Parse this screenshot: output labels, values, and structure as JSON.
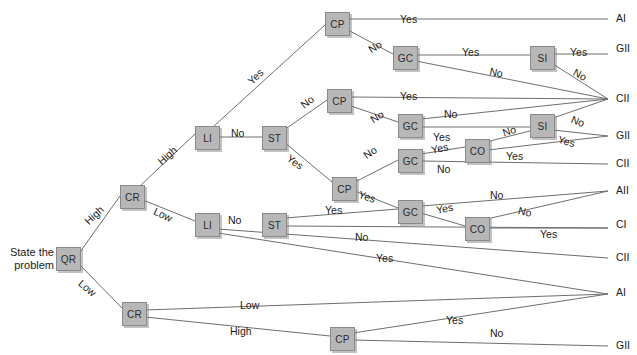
{
  "diagram": {
    "start_label": "State the\nproblem",
    "start_label_line1": "State the",
    "start_label_line2": "problem",
    "node_fill": "#b7b7b7",
    "node_stroke": "#8a8a8a",
    "line_color": "#6e6e6e",
    "nodes": [
      {
        "id": "QR",
        "label": "QR",
        "x": 56,
        "y": 247
      },
      {
        "id": "CR1",
        "label": "CR",
        "x": 120,
        "y": 185
      },
      {
        "id": "CR2",
        "label": "CR",
        "x": 122,
        "y": 302
      },
      {
        "id": "LI1",
        "label": "LI",
        "x": 195,
        "y": 126
      },
      {
        "id": "LI2",
        "label": "LI",
        "x": 195,
        "y": 213
      },
      {
        "id": "ST1",
        "label": "ST",
        "x": 262,
        "y": 126
      },
      {
        "id": "ST2",
        "label": "ST",
        "x": 262,
        "y": 213
      },
      {
        "id": "CP1",
        "label": "CP",
        "x": 325,
        "y": 12
      },
      {
        "id": "CP2",
        "label": "CP",
        "x": 327,
        "y": 89
      },
      {
        "id": "CP3",
        "label": "CP",
        "x": 332,
        "y": 177
      },
      {
        "id": "CP4",
        "label": "CP",
        "x": 330,
        "y": 327
      },
      {
        "id": "GC1",
        "label": "GC",
        "x": 393,
        "y": 46
      },
      {
        "id": "GC2",
        "label": "GC",
        "x": 398,
        "y": 114
      },
      {
        "id": "GC3",
        "label": "GC",
        "x": 398,
        "y": 149
      },
      {
        "id": "GC4",
        "label": "GC",
        "x": 398,
        "y": 200
      },
      {
        "id": "CO1",
        "label": "CO",
        "x": 465,
        "y": 139
      },
      {
        "id": "CO2",
        "label": "CO",
        "x": 465,
        "y": 217
      },
      {
        "id": "SI1",
        "label": "SI",
        "x": 530,
        "y": 46
      },
      {
        "id": "SI2",
        "label": "SI",
        "x": 530,
        "y": 114
      }
    ],
    "outcomes": [
      {
        "id": "o1",
        "label": "AI",
        "x": 616,
        "y": 12
      },
      {
        "id": "o2",
        "label": "GII",
        "x": 616,
        "y": 42
      },
      {
        "id": "o3",
        "label": "CII",
        "x": 616,
        "y": 92
      },
      {
        "id": "o4",
        "label": "GII",
        "x": 616,
        "y": 129
      },
      {
        "id": "o5",
        "label": "CII",
        "x": 616,
        "y": 157
      },
      {
        "id": "o6",
        "label": "AII",
        "x": 616,
        "y": 184
      },
      {
        "id": "o7",
        "label": "CI",
        "x": 616,
        "y": 218
      },
      {
        "id": "o8",
        "label": "CII",
        "x": 616,
        "y": 251
      },
      {
        "id": "o9",
        "label": "AI",
        "x": 616,
        "y": 286
      },
      {
        "id": "o10",
        "label": "GII",
        "x": 616,
        "y": 339
      }
    ],
    "edge_labels": [
      {
        "id": "e1",
        "text": "High",
        "x": 82,
        "y": 218,
        "rot": -43
      },
      {
        "id": "e2",
        "text": "Low",
        "x": 84,
        "y": 277,
        "rot": 40
      },
      {
        "id": "e3",
        "text": "High",
        "x": 155,
        "y": 158,
        "rot": -42
      },
      {
        "id": "e4",
        "text": "Low",
        "x": 157,
        "y": 205,
        "rot": 25
      },
      {
        "id": "e5",
        "text": "Yes",
        "x": 245,
        "y": 78,
        "rot": -44
      },
      {
        "id": "e6",
        "text": "No",
        "x": 231,
        "y": 127,
        "rot": 0
      },
      {
        "id": "e7",
        "text": "No",
        "x": 298,
        "y": 101,
        "rot": -38
      },
      {
        "id": "e8",
        "text": "Yes",
        "x": 292,
        "y": 152,
        "rot": 36
      },
      {
        "id": "e9",
        "text": "No",
        "x": 228,
        "y": 214,
        "rot": 0
      },
      {
        "id": "e10",
        "text": "Yes",
        "x": 325,
        "y": 204,
        "rot": 0
      },
      {
        "id": "e11",
        "text": "No",
        "x": 355,
        "y": 231,
        "rot": 0
      },
      {
        "id": "e12",
        "text": "Yes",
        "x": 376,
        "y": 252,
        "rot": 0
      },
      {
        "id": "e13",
        "text": "Yes",
        "x": 400,
        "y": 13,
        "rot": 0
      },
      {
        "id": "e14",
        "text": "No",
        "x": 366,
        "y": 45,
        "rot": -32
      },
      {
        "id": "e15",
        "text": "Yes",
        "x": 462,
        "y": 46,
        "rot": 0
      },
      {
        "id": "e16",
        "text": "No",
        "x": 491,
        "y": 65,
        "rot": 12
      },
      {
        "id": "e17",
        "text": "Yes",
        "x": 570,
        "y": 46,
        "rot": 0
      },
      {
        "id": "e18",
        "text": "No",
        "x": 577,
        "y": 66,
        "rot": 28
      },
      {
        "id": "e19",
        "text": "Yes",
        "x": 400,
        "y": 90,
        "rot": 0
      },
      {
        "id": "e20",
        "text": "No",
        "x": 368,
        "y": 115,
        "rot": -32
      },
      {
        "id": "e21",
        "text": "No",
        "x": 444,
        "y": 108,
        "rot": 0
      },
      {
        "id": "e22",
        "text": "Yes",
        "x": 433,
        "y": 131,
        "rot": 0
      },
      {
        "id": "e23",
        "text": "No",
        "x": 501,
        "y": 127,
        "rot": -18
      },
      {
        "id": "e24",
        "text": "No",
        "x": 574,
        "y": 113,
        "rot": 22
      },
      {
        "id": "e25",
        "text": "Yes",
        "x": 560,
        "y": 133,
        "rot": 16
      },
      {
        "id": "e26",
        "text": "No",
        "x": 361,
        "y": 151,
        "rot": -34
      },
      {
        "id": "e27",
        "text": "Yes",
        "x": 430,
        "y": 144,
        "rot": -12
      },
      {
        "id": "e28",
        "text": "No",
        "x": 437,
        "y": 163,
        "rot": 0
      },
      {
        "id": "e29",
        "text": "Yes",
        "x": 506,
        "y": 150,
        "rot": 0
      },
      {
        "id": "e30",
        "text": "Yes",
        "x": 361,
        "y": 188,
        "rot": 19
      },
      {
        "id": "e31",
        "text": "No",
        "x": 490,
        "y": 189,
        "rot": 0
      },
      {
        "id": "e32",
        "text": "No",
        "x": 520,
        "y": 204,
        "rot": 14
      },
      {
        "id": "e33",
        "text": "Yes",
        "x": 435,
        "y": 204,
        "rot": -11
      },
      {
        "id": "e34",
        "text": "Yes",
        "x": 540,
        "y": 228,
        "rot": 0
      },
      {
        "id": "e35",
        "text": "Low",
        "x": 240,
        "y": 299,
        "rot": 0
      },
      {
        "id": "e36",
        "text": "High",
        "x": 230,
        "y": 325,
        "rot": 0
      },
      {
        "id": "e37",
        "text": "Yes",
        "x": 446,
        "y": 314,
        "rot": 0
      },
      {
        "id": "e38",
        "text": "No",
        "x": 490,
        "y": 327,
        "rot": 0
      }
    ],
    "edges": [
      {
        "id": "E-QR-CR1",
        "from": "QR",
        "to": "CR1",
        "label": "High"
      },
      {
        "id": "E-QR-CR2",
        "from": "QR",
        "to": "CR2",
        "label": "Low"
      },
      {
        "id": "E-CR1-LI1",
        "from": "CR1",
        "to": "LI1",
        "label": "High"
      },
      {
        "id": "E-CR1-LI2",
        "from": "CR1",
        "to": "LI2",
        "label": "Low"
      },
      {
        "id": "E-LI1-CP1",
        "from": "LI1",
        "to": "CP1",
        "label": "Yes"
      },
      {
        "id": "E-LI1-ST1",
        "from": "LI1",
        "to": "ST1",
        "label": "No"
      },
      {
        "id": "E-ST1-CP2",
        "from": "ST1",
        "to": "CP2",
        "label": "No"
      },
      {
        "id": "E-ST1-CP3",
        "from": "ST1",
        "to": "CP3",
        "label": "Yes"
      },
      {
        "id": "E-CP1-AI",
        "from": "CP1",
        "to": "o1",
        "label": "Yes"
      },
      {
        "id": "E-CP1-GC1",
        "from": "CP1",
        "to": "GC1",
        "label": "No"
      },
      {
        "id": "E-GC1-SI1",
        "from": "GC1",
        "to": "SI1",
        "label": "Yes"
      },
      {
        "id": "E-GC1-CII",
        "from": "GC1",
        "to": "o3",
        "label": "No"
      },
      {
        "id": "E-SI1-GII",
        "from": "SI1",
        "to": "o2",
        "label": "Yes"
      },
      {
        "id": "E-SI1-CII",
        "from": "SI1",
        "to": "o3",
        "label": "No"
      },
      {
        "id": "E-CP2-CII",
        "from": "CP2",
        "to": "o3",
        "label": "Yes"
      },
      {
        "id": "E-CP2-GC2",
        "from": "CP2",
        "to": "GC2",
        "label": "No"
      },
      {
        "id": "E-GC2-CII",
        "from": "GC2",
        "to": "o3",
        "label": "No"
      },
      {
        "id": "E-GC2-SI2",
        "from": "GC2",
        "to": "SI2",
        "label": "Yes"
      },
      {
        "id": "E-SI2-GII",
        "from": "SI2",
        "to": "o4",
        "label": "Yes"
      },
      {
        "id": "E-SI2-CII",
        "from": "SI2",
        "to": "o3",
        "label": "No"
      },
      {
        "id": "E-GC3-CO1",
        "from": "GC3",
        "to": "CO1",
        "label": "Yes"
      },
      {
        "id": "E-GC3-CII",
        "from": "GC3",
        "to": "o5",
        "label": "No"
      },
      {
        "id": "E-CO1-SI2",
        "from": "CO1",
        "to": "SI2",
        "label": "No"
      },
      {
        "id": "E-CO1-GII",
        "from": "CO1",
        "to": "o4",
        "label": "Yes"
      },
      {
        "id": "E-CP3-GC3",
        "from": "CP3",
        "to": "GC3",
        "label": "No"
      },
      {
        "id": "E-CP3-GC4",
        "from": "CP3",
        "to": "GC4",
        "label": "Yes"
      },
      {
        "id": "E-GC4-AII",
        "from": "GC4",
        "to": "o6",
        "label": "No"
      },
      {
        "id": "E-GC4-CO2",
        "from": "GC4",
        "to": "CO2",
        "label": "Yes"
      },
      {
        "id": "E-CO2-AII",
        "from": "CO2",
        "to": "o6",
        "label": "No"
      },
      {
        "id": "E-CO2-CI",
        "from": "CO2",
        "to": "o7",
        "label": "Yes"
      },
      {
        "id": "E-ST2-GC4",
        "from": "ST2",
        "to": "GC4",
        "label": "Yes"
      },
      {
        "id": "E-ST2-CI",
        "from": "ST2",
        "to": "o7",
        "label": "No"
      },
      {
        "id": "E-LI2-CII",
        "from": "LI2",
        "to": "o8",
        "label": "Yes"
      },
      {
        "id": "E-LI2-AI",
        "from": "LI2",
        "to": "o9",
        "label": ""
      },
      {
        "id": "E-CR2-AI",
        "from": "CR2",
        "to": "o9",
        "label": "Low"
      },
      {
        "id": "E-CR2-CP4",
        "from": "CR2",
        "to": "CP4",
        "label": "High"
      },
      {
        "id": "E-CP4-AI",
        "from": "CP4",
        "to": "o9",
        "label": "Yes"
      },
      {
        "id": "E-CP4-GII",
        "from": "CP4",
        "to": "o10",
        "label": "No"
      }
    ]
  }
}
